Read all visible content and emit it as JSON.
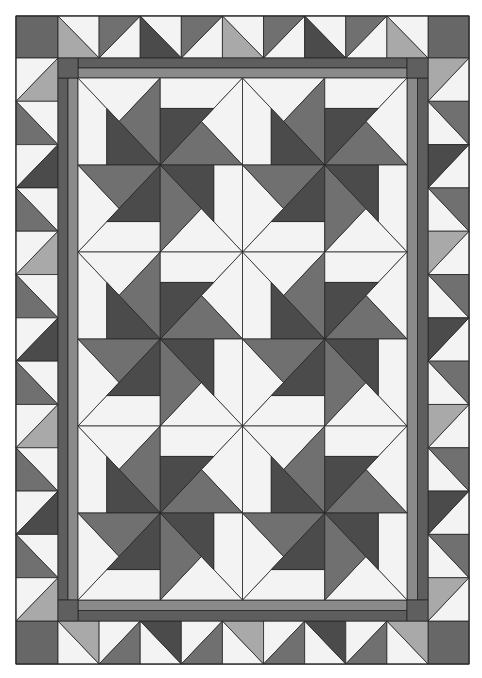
{
  "image": {
    "subject": "Pinwheel quilt with half-square-triangle border",
    "width": 482,
    "height": 678
  },
  "colors": {
    "background": "#ffffff",
    "white": "#f3f3f3",
    "light": "#a9a9a9",
    "medium": "#707070",
    "dark": "#4b4b4b",
    "inner_border_outer": "#5e5e5e",
    "inner_border_inner": "#8a8a8a",
    "inner_border_corner": "#5f5f5f",
    "corner_square": "#676767",
    "seam_line": "#262626"
  },
  "quilt": {
    "outer_rect": [
      16,
      16,
      469,
      664
    ],
    "inner_border_rect": [
      58,
      58,
      428,
      621
    ],
    "center_rect": [
      78,
      78,
      407,
      600
    ],
    "inner_border_strip_split": 0.5,
    "center_grid": {
      "cols": 4,
      "rows": 6
    },
    "pinwheel_blocks": {
      "cols": 2,
      "rows": 3
    },
    "cell_strip_fraction": 0.35,
    "cell_fills": {
      "triangle": "white",
      "wing": "medium",
      "blade": "dark",
      "strip": "white"
    },
    "border": {
      "top": {
        "count": 9,
        "squares": [
          {
            "diag": "tlbr",
            "colored_half": "bottom-left",
            "color": "light"
          },
          {
            "diag": "bltr",
            "colored_half": "top-left",
            "color": "medium"
          },
          {
            "diag": "tlbr",
            "colored_half": "bottom-left",
            "color": "dark"
          },
          {
            "diag": "bltr",
            "colored_half": "top-left",
            "color": "medium"
          },
          {
            "diag": "tlbr",
            "colored_half": "bottom-left",
            "color": "light"
          },
          {
            "diag": "bltr",
            "colored_half": "top-left",
            "color": "medium"
          },
          {
            "diag": "tlbr",
            "colored_half": "bottom-left",
            "color": "dark"
          },
          {
            "diag": "bltr",
            "colored_half": "top-left",
            "color": "medium"
          },
          {
            "diag": "tlbr",
            "colored_half": "bottom-left",
            "color": "light"
          }
        ]
      },
      "bottom": {
        "count": 9,
        "squares": [
          {
            "diag": "tlbr",
            "colored_half": "top-right",
            "color": "light"
          },
          {
            "diag": "bltr",
            "colored_half": "bottom-right",
            "color": "medium"
          },
          {
            "diag": "tlbr",
            "colored_half": "top-right",
            "color": "dark"
          },
          {
            "diag": "bltr",
            "colored_half": "bottom-right",
            "color": "medium"
          },
          {
            "diag": "tlbr",
            "colored_half": "top-right",
            "color": "light"
          },
          {
            "diag": "bltr",
            "colored_half": "bottom-right",
            "color": "medium"
          },
          {
            "diag": "tlbr",
            "colored_half": "top-right",
            "color": "dark"
          },
          {
            "diag": "bltr",
            "colored_half": "bottom-right",
            "color": "medium"
          },
          {
            "diag": "tlbr",
            "colored_half": "top-right",
            "color": "light"
          }
        ]
      },
      "left": {
        "count": 13,
        "squares": [
          {
            "diag": "bltr",
            "colored_half": "bottom-right",
            "color": "light"
          },
          {
            "diag": "tlbr",
            "colored_half": "bottom-left",
            "color": "medium"
          },
          {
            "diag": "bltr",
            "colored_half": "bottom-right",
            "color": "dark"
          },
          {
            "diag": "tlbr",
            "colored_half": "bottom-left",
            "color": "medium"
          },
          {
            "diag": "bltr",
            "colored_half": "bottom-right",
            "color": "light"
          },
          {
            "diag": "tlbr",
            "colored_half": "bottom-left",
            "color": "medium"
          },
          {
            "diag": "bltr",
            "colored_half": "bottom-right",
            "color": "dark"
          },
          {
            "diag": "tlbr",
            "colored_half": "bottom-left",
            "color": "medium"
          },
          {
            "diag": "bltr",
            "colored_half": "bottom-right",
            "color": "light"
          },
          {
            "diag": "tlbr",
            "colored_half": "bottom-left",
            "color": "medium"
          },
          {
            "diag": "bltr",
            "colored_half": "bottom-right",
            "color": "dark"
          },
          {
            "diag": "tlbr",
            "colored_half": "bottom-left",
            "color": "medium"
          },
          {
            "diag": "bltr",
            "colored_half": "bottom-right",
            "color": "light"
          }
        ]
      },
      "right": {
        "count": 13,
        "squares": [
          {
            "diag": "bltr",
            "colored_half": "top-left",
            "color": "light"
          },
          {
            "diag": "tlbr",
            "colored_half": "top-right",
            "color": "medium"
          },
          {
            "diag": "bltr",
            "colored_half": "top-left",
            "color": "dark"
          },
          {
            "diag": "tlbr",
            "colored_half": "top-right",
            "color": "medium"
          },
          {
            "diag": "bltr",
            "colored_half": "top-left",
            "color": "light"
          },
          {
            "diag": "tlbr",
            "colored_half": "top-right",
            "color": "medium"
          },
          {
            "diag": "bltr",
            "colored_half": "top-left",
            "color": "dark"
          },
          {
            "diag": "tlbr",
            "colored_half": "top-right",
            "color": "medium"
          },
          {
            "diag": "bltr",
            "colored_half": "top-left",
            "color": "light"
          },
          {
            "diag": "tlbr",
            "colored_half": "top-right",
            "color": "medium"
          },
          {
            "diag": "bltr",
            "colored_half": "top-left",
            "color": "dark"
          },
          {
            "diag": "tlbr",
            "colored_half": "top-right",
            "color": "medium"
          },
          {
            "diag": "bltr",
            "colored_half": "top-left",
            "color": "light"
          }
        ]
      }
    }
  }
}
